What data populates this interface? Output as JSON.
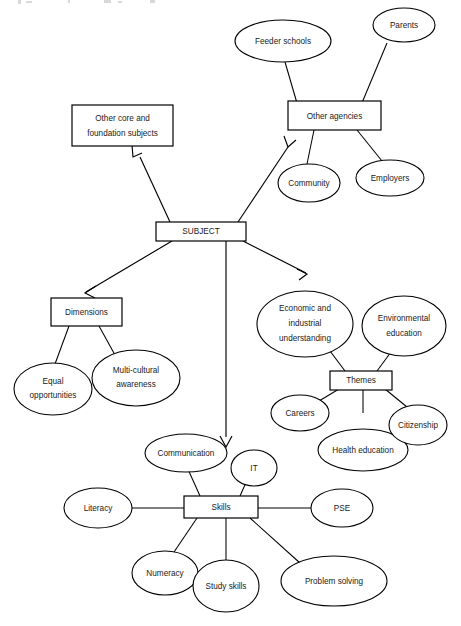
{
  "diagram": {
    "type": "concept-map",
    "background_color": "#ffffff",
    "line_color": "#000000",
    "text_color": "#1a1a1a",
    "nodes": {
      "subject": {
        "label": "SUBJECT",
        "shape": "box"
      },
      "other_core": {
        "label_line1": "Other core and",
        "label_line2": "foundation subjects",
        "shape": "box"
      },
      "other_agencies": {
        "label": "Other agencies",
        "shape": "box"
      },
      "feeder_schools": {
        "label": "Feeder schools",
        "shape": "ellipse"
      },
      "parents": {
        "label": "Parents",
        "shape": "ellipse"
      },
      "community": {
        "label": "Community",
        "shape": "ellipse"
      },
      "employers": {
        "label": "Employers",
        "shape": "ellipse"
      },
      "dimensions": {
        "label": "Dimensions",
        "shape": "box"
      },
      "equal_opportunities": {
        "label_line1": "Equal",
        "label_line2": "opportunities",
        "shape": "ellipse"
      },
      "multi_cultural": {
        "label_line1": "Multi-cultural",
        "label_line2": "awareness",
        "shape": "ellipse"
      },
      "themes": {
        "label": "Themes",
        "shape": "box"
      },
      "economic": {
        "label_line1": "Economic and",
        "label_line2": "industrial",
        "label_line3": "understanding",
        "shape": "ellipse"
      },
      "environmental": {
        "label_line1": "Environmental",
        "label_line2": "education",
        "shape": "ellipse"
      },
      "careers": {
        "label": "Careers",
        "shape": "ellipse"
      },
      "health_education": {
        "label": "Health education",
        "shape": "ellipse"
      },
      "citizenship": {
        "label": "Citizenship",
        "shape": "ellipse"
      },
      "skills": {
        "label": "Skills",
        "shape": "box"
      },
      "communication": {
        "label": "Communication",
        "shape": "ellipse"
      },
      "it": {
        "label": "IT",
        "shape": "ellipse"
      },
      "literacy": {
        "label": "Literacy",
        "shape": "ellipse"
      },
      "pse": {
        "label": "PSE",
        "shape": "ellipse"
      },
      "numeracy": {
        "label": "Numeracy",
        "shape": "ellipse"
      },
      "study_skills": {
        "label": "Study skills",
        "shape": "ellipse"
      },
      "problem_solving": {
        "label": "Problem solving",
        "shape": "ellipse"
      }
    },
    "edges": [
      {
        "from": "subject",
        "to": "other_core",
        "arrow": true
      },
      {
        "from": "subject",
        "to": "other_agencies",
        "arrow": true
      },
      {
        "from": "subject",
        "to": "dimensions",
        "arrow": true
      },
      {
        "from": "subject",
        "to": "themes",
        "arrow": true
      },
      {
        "from": "subject",
        "to": "skills",
        "arrow": true
      },
      {
        "from": "other_agencies",
        "to": "feeder_schools",
        "arrow": false
      },
      {
        "from": "other_agencies",
        "to": "parents",
        "arrow": false
      },
      {
        "from": "other_agencies",
        "to": "community",
        "arrow": false
      },
      {
        "from": "other_agencies",
        "to": "employers",
        "arrow": false
      },
      {
        "from": "dimensions",
        "to": "equal_opportunities",
        "arrow": false
      },
      {
        "from": "dimensions",
        "to": "multi_cultural",
        "arrow": false
      },
      {
        "from": "themes",
        "to": "economic",
        "arrow": false
      },
      {
        "from": "themes",
        "to": "environmental",
        "arrow": false
      },
      {
        "from": "themes",
        "to": "careers",
        "arrow": false
      },
      {
        "from": "themes",
        "to": "health_education",
        "arrow": false
      },
      {
        "from": "themes",
        "to": "citizenship",
        "arrow": false
      },
      {
        "from": "skills",
        "to": "communication",
        "arrow": false
      },
      {
        "from": "skills",
        "to": "it",
        "arrow": false
      },
      {
        "from": "skills",
        "to": "literacy",
        "arrow": false
      },
      {
        "from": "skills",
        "to": "pse",
        "arrow": false
      },
      {
        "from": "skills",
        "to": "numeracy",
        "arrow": false
      },
      {
        "from": "skills",
        "to": "study_skills",
        "arrow": false
      },
      {
        "from": "skills",
        "to": "problem_solving",
        "arrow": false
      }
    ]
  }
}
